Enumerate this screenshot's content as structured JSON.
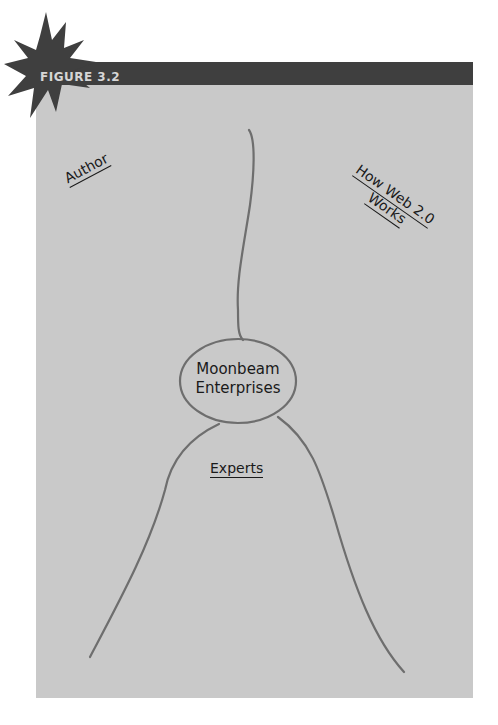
{
  "figure": {
    "label": "FIGURE 3.2"
  },
  "diagram": {
    "center_node": {
      "line1": "Moonbeam",
      "line2": "Enterprises"
    },
    "labels": {
      "author": "Author",
      "how_web_line1": "How Web 2.0",
      "how_web_line2": "Works",
      "experts": "Experts"
    }
  },
  "colors": {
    "panel": "#c9c9c9",
    "header_bar": "#3f3f3f",
    "starburst": "#3f3f3f",
    "line": "#6e6e6e",
    "text": "#1a1a1a"
  }
}
